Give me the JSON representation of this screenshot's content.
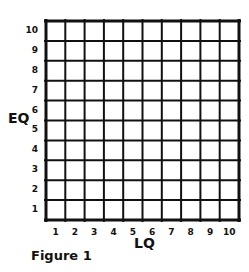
{
  "figure": {
    "caption": "Figure 1",
    "x_axis_title": "LQ",
    "y_axis_title": "EQ",
    "x_ticks": [
      "1",
      "2",
      "3",
      "4",
      "5",
      "6",
      "7",
      "8",
      "9",
      "10"
    ],
    "y_ticks": [
      "10",
      "9",
      "8",
      "7",
      "6",
      "5",
      "4",
      "3",
      "2",
      "1"
    ],
    "grid": {
      "columns": 10,
      "rows": 10,
      "line_color": "#111111",
      "background": "#ffffff"
    }
  }
}
